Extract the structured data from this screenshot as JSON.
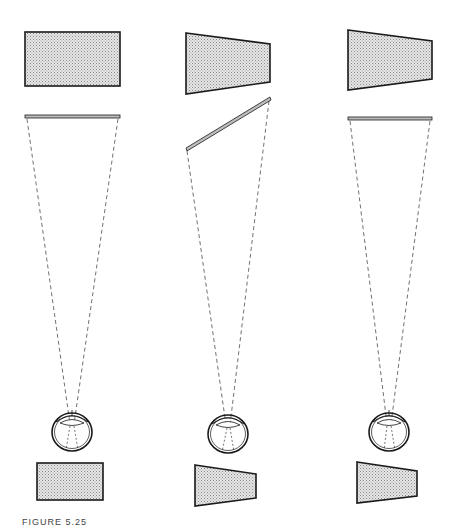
{
  "caption": "FIGURE 5.25",
  "colors": {
    "outline": "#1a1a1a",
    "stipple_fill": "#cfcfcf",
    "dash": "#333333",
    "background": "#ffffff"
  },
  "panels": [
    {
      "id": "left",
      "object_shape": "rectangle",
      "screen_orientation": "frontal",
      "retinal_image_shape": "rectangle"
    },
    {
      "id": "middle",
      "object_shape": "trapezoid",
      "screen_orientation": "slanted",
      "retinal_image_shape": "trapezoid"
    },
    {
      "id": "right",
      "object_shape": "trapezoid",
      "screen_orientation": "frontal",
      "retinal_image_shape": "trapezoid"
    }
  ]
}
